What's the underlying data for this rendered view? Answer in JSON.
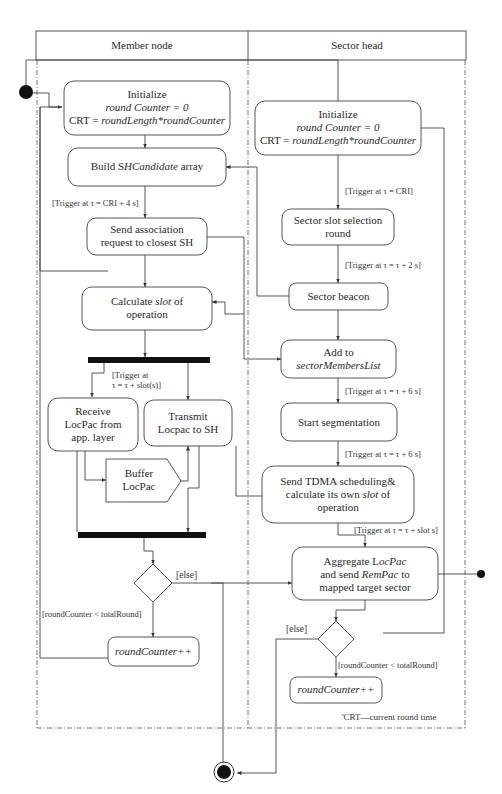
{
  "swimlanes": [
    {
      "id": "member",
      "title": "Member node"
    },
    {
      "id": "sector",
      "title": "Sector head"
    }
  ],
  "member": {
    "init": {
      "line1": "Initialize",
      "line2": "round Counter = 0",
      "line3_prefix": "CRT = ",
      "line3_italic": "roundLength*roundCounter"
    },
    "build": {
      "prefix": "Build S",
      "italic": "HCandidate",
      "suffix": " array"
    },
    "trigger_build": "[Trigger at τ = CRI + 4 s]",
    "send_assoc": {
      "line1": "Send association",
      "line2": "request to closest SH"
    },
    "calc_slot": {
      "prefix": "Calculate ",
      "italic": "slot",
      "suffix": " of",
      "line2": "operation"
    },
    "trigger_slot": {
      "line1": "[Trigger at",
      "line2": "τ = τ + slot(s)]"
    },
    "receive": {
      "line1": "Receive",
      "line2": "LocPac from",
      "line3": "app. layer"
    },
    "transmit": {
      "line1": "Transmit",
      "line2": "Locpac to SH"
    },
    "buffer": {
      "line1": "Buffer",
      "line2": "LocPac"
    },
    "guard_loop": "[roundCounter < totalRound]",
    "guard_else": "[else]",
    "increment": "roundCounter++"
  },
  "sector": {
    "init": {
      "line1": "Initialize",
      "line2": "round Counter = 0",
      "line3_prefix": "CRT = ",
      "line3_italic": "roundLength*roundCounter"
    },
    "trigger_cri": "[Trigger at τ = CRI]",
    "slot_sel": {
      "line1": "Sector slot selection",
      "line2": "round"
    },
    "trigger_2s": "[Trigger at τ = τ + 2 s]",
    "beacon": "Sector beacon",
    "add": {
      "line1": "Add to",
      "line2": "sectorMembersList"
    },
    "trigger_6s_a": "[Trigger at τ = τ + 6 s]",
    "segmentation": "Start segmentation",
    "trigger_6s_b": "[Trigger at τ = τ + 6 s]",
    "tdma": {
      "line1": "Send TDMA scheduling&",
      "line2_prefix": "calculate its own ",
      "line2_italic": "slot",
      "line2_suffix": " of",
      "line3": "operation"
    },
    "trigger_slot_s": "[Trigger at τ = τ + slot s]",
    "aggregate": {
      "line1_prefix": "Aggregate L",
      "line1_italic": "ocPac",
      "line2_prefix": "and send ",
      "line2_italic": "RemPac",
      "line2_suffix": " to",
      "line3": "mapped target sector"
    },
    "guard_else": "[else]",
    "guard_loop": "[roundCounter < totalRound]",
    "increment": "roundCounter++"
  },
  "footnote": "'CRT—current round time"
}
